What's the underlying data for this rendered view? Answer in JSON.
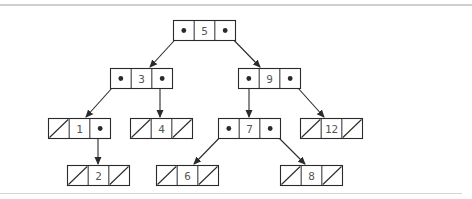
{
  "diagram": {
    "stroke_color": "#2a2a2a",
    "text_color": "#555555",
    "rule_color": "#cfcfcf",
    "node_width": 62,
    "node_height": 20,
    "nodes": [
      {
        "id": "n5",
        "value": "5",
        "x": 173,
        "y": 20,
        "left": "n3",
        "right": "n9"
      },
      {
        "id": "n3",
        "value": "3",
        "x": 110,
        "y": 68,
        "left": "n1",
        "right": "n4"
      },
      {
        "id": "n9",
        "value": "9",
        "x": 238,
        "y": 68,
        "left": "n7",
        "right": "n12"
      },
      {
        "id": "n1",
        "value": "1",
        "x": 48,
        "y": 118,
        "left": null,
        "right": "n2"
      },
      {
        "id": "n4",
        "value": "4",
        "x": 130,
        "y": 118,
        "left": null,
        "right": null
      },
      {
        "id": "n7",
        "value": "7",
        "x": 218,
        "y": 118,
        "left": "n6",
        "right": "n8"
      },
      {
        "id": "n12",
        "value": "12",
        "x": 300,
        "y": 118,
        "left": null,
        "right": null
      },
      {
        "id": "n2",
        "value": "2",
        "x": 67,
        "y": 165,
        "left": null,
        "right": null
      },
      {
        "id": "n6",
        "value": "6",
        "x": 156,
        "y": 165,
        "left": null,
        "right": null
      },
      {
        "id": "n8",
        "value": "8",
        "x": 280,
        "y": 165,
        "left": null,
        "right": null
      }
    ],
    "edges": [
      {
        "from": "n5",
        "side": "left",
        "x1": 184,
        "y1": 30,
        "x2": 150,
        "y2": 67
      },
      {
        "from": "n5",
        "side": "right",
        "x1": 224,
        "y1": 30,
        "x2": 260,
        "y2": 67
      },
      {
        "from": "n3",
        "side": "left",
        "x1": 121,
        "y1": 78,
        "x2": 86,
        "y2": 117
      },
      {
        "from": "n3",
        "side": "right",
        "x1": 160,
        "y1": 78,
        "x2": 160,
        "y2": 117
      },
      {
        "from": "n9",
        "side": "left",
        "x1": 249,
        "y1": 78,
        "x2": 249,
        "y2": 117
      },
      {
        "from": "n9",
        "side": "right",
        "x1": 289,
        "y1": 78,
        "x2": 324,
        "y2": 117
      },
      {
        "from": "n1",
        "side": "right",
        "x1": 98,
        "y1": 128,
        "x2": 98,
        "y2": 164
      },
      {
        "from": "n7",
        "side": "left",
        "x1": 229,
        "y1": 128,
        "x2": 194,
        "y2": 164
      },
      {
        "from": "n7",
        "side": "right",
        "x1": 269,
        "y1": 128,
        "x2": 305,
        "y2": 164
      }
    ]
  }
}
